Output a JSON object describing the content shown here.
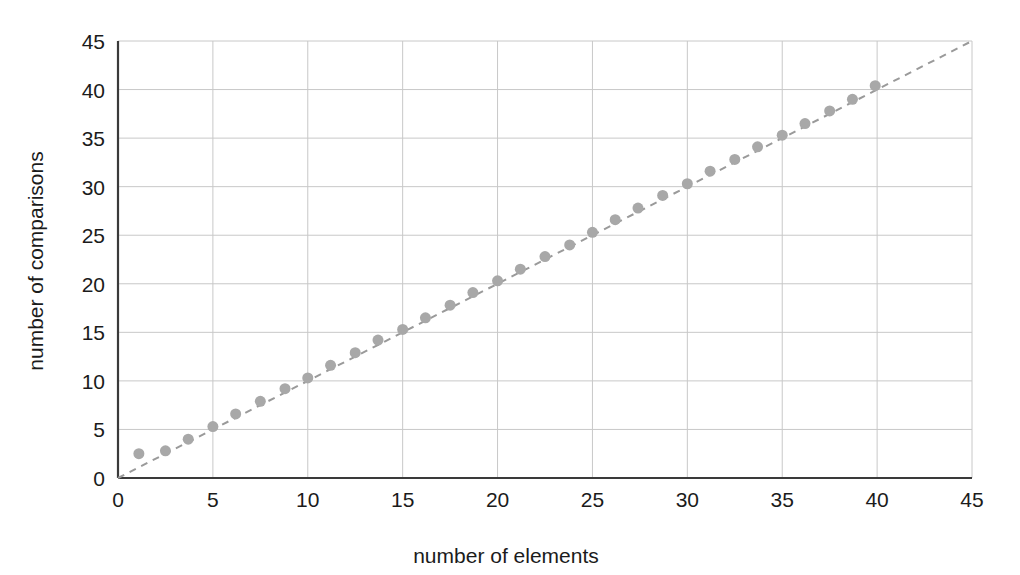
{
  "chart_data": {
    "type": "scatter",
    "title": "",
    "subtitle": "",
    "xlabel": "number of elements",
    "ylabel": "number of comparisons",
    "xlim": [
      0,
      45
    ],
    "ylim": [
      0,
      45
    ],
    "xticks": [
      0,
      5,
      10,
      15,
      20,
      25,
      30,
      35,
      40,
      45
    ],
    "xtick_labels": [
      "0",
      "5",
      "10",
      "15",
      "20",
      "25",
      "30",
      "35",
      "40",
      "45"
    ],
    "yticks": [
      0,
      5,
      10,
      15,
      20,
      25,
      30,
      35,
      40,
      45
    ],
    "ytick_labels": [
      "0",
      "5",
      "10",
      "15",
      "20",
      "25",
      "30",
      "35",
      "40",
      "45"
    ],
    "grid": true,
    "legend": false,
    "legend_position": "none",
    "marker_color": "#a8a8a8",
    "marker_size": 11,
    "gridline_color": "#c8c8c8",
    "axis_color": "#3a3a3a",
    "background_color": "#ffffff",
    "series": [
      {
        "name": "measured comparisons",
        "type": "scatter",
        "color": "#a8a8a8",
        "x": [
          1.1,
          2.5,
          3.7,
          5.0,
          6.2,
          7.5,
          8.8,
          10.0,
          11.2,
          12.5,
          13.7,
          15.0,
          16.2,
          17.5,
          18.7,
          20.0,
          21.2,
          22.5,
          23.8,
          25.0,
          26.2,
          27.4,
          28.7,
          30.0,
          31.2,
          32.5,
          33.7,
          35.0,
          36.2,
          37.5,
          38.7,
          39.9
        ],
        "y": [
          2.5,
          2.8,
          4.0,
          5.3,
          6.6,
          7.9,
          9.2,
          10.3,
          11.6,
          12.9,
          14.2,
          15.3,
          16.5,
          17.8,
          19.1,
          20.3,
          21.5,
          22.8,
          24.0,
          25.3,
          26.6,
          27.8,
          29.1,
          30.3,
          31.6,
          32.8,
          34.1,
          35.3,
          36.5,
          37.8,
          39.0,
          40.4
        ]
      },
      {
        "name": "reference trend line",
        "type": "line",
        "style": "dashed",
        "color": "#9a9a9a",
        "x": [
          0,
          45
        ],
        "y": [
          0,
          45
        ]
      }
    ]
  },
  "figure": {
    "x_axis_label": "number of elements",
    "y_axis_label": "number of comparisons"
  }
}
